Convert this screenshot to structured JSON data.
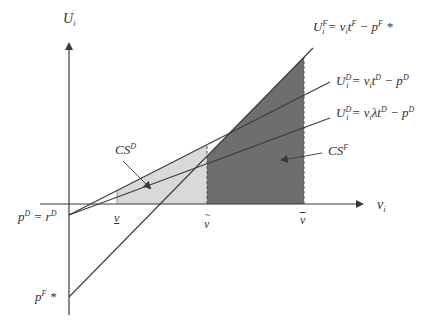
{
  "diagram": {
    "y_axis_label": {
      "base": "U",
      "sub": "i"
    },
    "x_axis_label": {
      "base": "v",
      "sub": "i"
    },
    "equations": [
      {
        "id": "UF",
        "lhs": "U",
        "lhs_sup": "F",
        "lhs_sub": "i",
        "rhs": "= v",
        "rhs_sub": "i",
        "t": "t",
        "t_sup": "F",
        "minus": " − p",
        "p_sup": "F",
        "tail": " *"
      },
      {
        "id": "UD",
        "lhs": "U",
        "lhs_sup": "D",
        "lhs_sub": "i",
        "rhs": "= v",
        "rhs_sub": "i",
        "t": "t",
        "t_sup": "D",
        "minus": " − p",
        "p_sup": "D",
        "tail": ""
      },
      {
        "id": "UDlambda",
        "lhs": "U",
        "lhs_sup": "D",
        "lhs_sub": "i",
        "rhs": "= v",
        "rhs_sub": "i",
        "t": "λt",
        "t_sup": "D",
        "minus": " − p",
        "p_sup": "D",
        "tail": ""
      }
    ],
    "intercept_labels": {
      "pD": {
        "p": "p",
        "p_sup": "D",
        "eq": " = r",
        "r_sup": "D"
      },
      "pF": {
        "p": "p",
        "p_sup": "F",
        "tail": " *"
      }
    },
    "x_markers": [
      {
        "id": "v_underline",
        "label": "v"
      },
      {
        "id": "v_tilde",
        "label": "v"
      },
      {
        "id": "v_bar",
        "label": "v"
      }
    ],
    "region_labels": {
      "CSD": {
        "base": "CS",
        "sup": "D"
      },
      "CSF": {
        "base": "CS",
        "sup": "F"
      }
    },
    "colors": {
      "axis": "#3a3a3a",
      "line": "#3a3a3a",
      "cs_d_fill": "#d9d9d9",
      "cs_f_fill": "#6e6e6e",
      "text": "#333333"
    }
  }
}
